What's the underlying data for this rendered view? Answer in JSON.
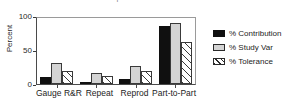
{
  "chart_data": {
    "type": "bar",
    "title": "Components of Variation",
    "xlabel": "",
    "ylabel": "Percent",
    "ylim": [
      0,
      100
    ],
    "yticks": [
      0,
      50,
      100
    ],
    "ytick_labels": [
      "0",
      "50",
      "100"
    ],
    "grid": false,
    "legend_position": "right",
    "categories": [
      "Gauge R&R",
      "Repeat",
      "Reprod",
      "Part-to-Part"
    ],
    "series": [
      {
        "name": "% Contribution",
        "swatch": "contribution",
        "color": "#101010",
        "values": [
          10,
          3,
          7,
          88
        ]
      },
      {
        "name": "% Study Var",
        "swatch": "studyvar",
        "color": "#d4d4d4",
        "values": [
          32,
          16,
          27,
          93
        ]
      },
      {
        "name": "% Tolerance",
        "swatch": "tolerance",
        "color": "#ffffff",
        "values": [
          19,
          12,
          19,
          64
        ]
      }
    ]
  }
}
